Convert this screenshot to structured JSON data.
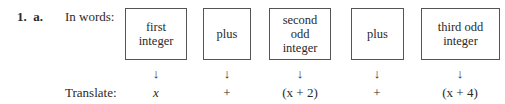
{
  "problem": {
    "number": "1.",
    "part": "a.",
    "words_label": "In words:",
    "translate_label": "Translate:"
  },
  "columns": [
    {
      "words_lines": [
        "first",
        "integer"
      ],
      "arrow": "↓",
      "translation": "x"
    },
    {
      "words_lines": [
        "plus"
      ],
      "arrow": "↓",
      "translation": "+"
    },
    {
      "words_lines": [
        "second",
        "odd",
        "integer"
      ],
      "arrow": "↓",
      "translation": "(x + 2)"
    },
    {
      "words_lines": [
        "plus"
      ],
      "arrow": "↓",
      "translation": "+"
    },
    {
      "words_lines": [
        "third odd",
        "integer"
      ],
      "arrow": "↓",
      "translation": "(x + 4)"
    }
  ]
}
